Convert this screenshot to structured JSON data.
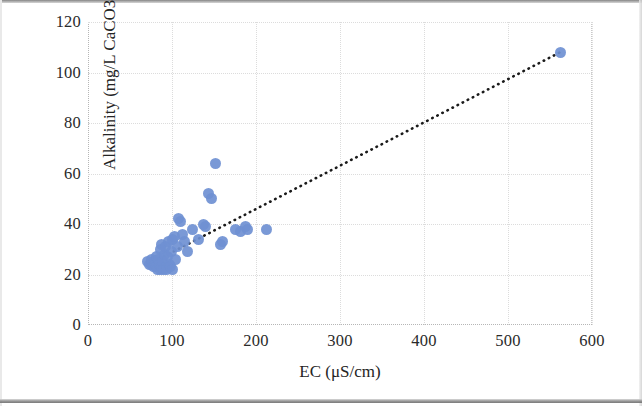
{
  "chart_data": {
    "type": "scatter",
    "title": "",
    "xlabel": "EC (μS/cm)",
    "ylabel": "Alkalinity (mg/L CaCO3)",
    "xlim": [
      0,
      600
    ],
    "ylim": [
      0,
      120
    ],
    "xticks": [
      0,
      100,
      200,
      300,
      400,
      500,
      600
    ],
    "yticks": [
      0,
      20,
      40,
      60,
      80,
      100,
      120
    ],
    "grid": true,
    "legend": "none",
    "marker_color": "#6f90d2",
    "trendline": {
      "style": "dotted",
      "color": "#1a1a1a",
      "x_start": 72,
      "y_start": 24,
      "x_end": 562,
      "y_end": 108
    },
    "series": [
      {
        "name": "Alkalinity vs EC",
        "points": [
          [
            71,
            25
          ],
          [
            73,
            24
          ],
          [
            75,
            24
          ],
          [
            76,
            26
          ],
          [
            78,
            23
          ],
          [
            79,
            25
          ],
          [
            80,
            24
          ],
          [
            81,
            27
          ],
          [
            82,
            23
          ],
          [
            83,
            22
          ],
          [
            84,
            26
          ],
          [
            85,
            24
          ],
          [
            86,
            30
          ],
          [
            86,
            22
          ],
          [
            87,
            23
          ],
          [
            88,
            32
          ],
          [
            89,
            25
          ],
          [
            90,
            22
          ],
          [
            91,
            28
          ],
          [
            92,
            31
          ],
          [
            93,
            23
          ],
          [
            94,
            22
          ],
          [
            95,
            27
          ],
          [
            96,
            33
          ],
          [
            97,
            24
          ],
          [
            98,
            23
          ],
          [
            99,
            29
          ],
          [
            100,
            34
          ],
          [
            101,
            22
          ],
          [
            103,
            35
          ],
          [
            104,
            26
          ],
          [
            106,
            31
          ],
          [
            108,
            42
          ],
          [
            110,
            41
          ],
          [
            112,
            36
          ],
          [
            115,
            33
          ],
          [
            118,
            29
          ],
          [
            124,
            38
          ],
          [
            131,
            34
          ],
          [
            138,
            40
          ],
          [
            140,
            39
          ],
          [
            144,
            52
          ],
          [
            147,
            50
          ],
          [
            152,
            64
          ],
          [
            158,
            32
          ],
          [
            160,
            33
          ],
          [
            176,
            38
          ],
          [
            182,
            37
          ],
          [
            188,
            39
          ],
          [
            190,
            38
          ],
          [
            212,
            38
          ],
          [
            562,
            108
          ]
        ]
      }
    ]
  },
  "axis": {
    "x_title": "EC (μS/cm)",
    "y_title": "Alkalinity (mg/L CaCO3)",
    "x_tick_labels": [
      "0",
      "100",
      "200",
      "300",
      "400",
      "500",
      "600"
    ],
    "y_tick_labels": [
      "0",
      "20",
      "40",
      "60",
      "80",
      "100",
      "120"
    ]
  }
}
